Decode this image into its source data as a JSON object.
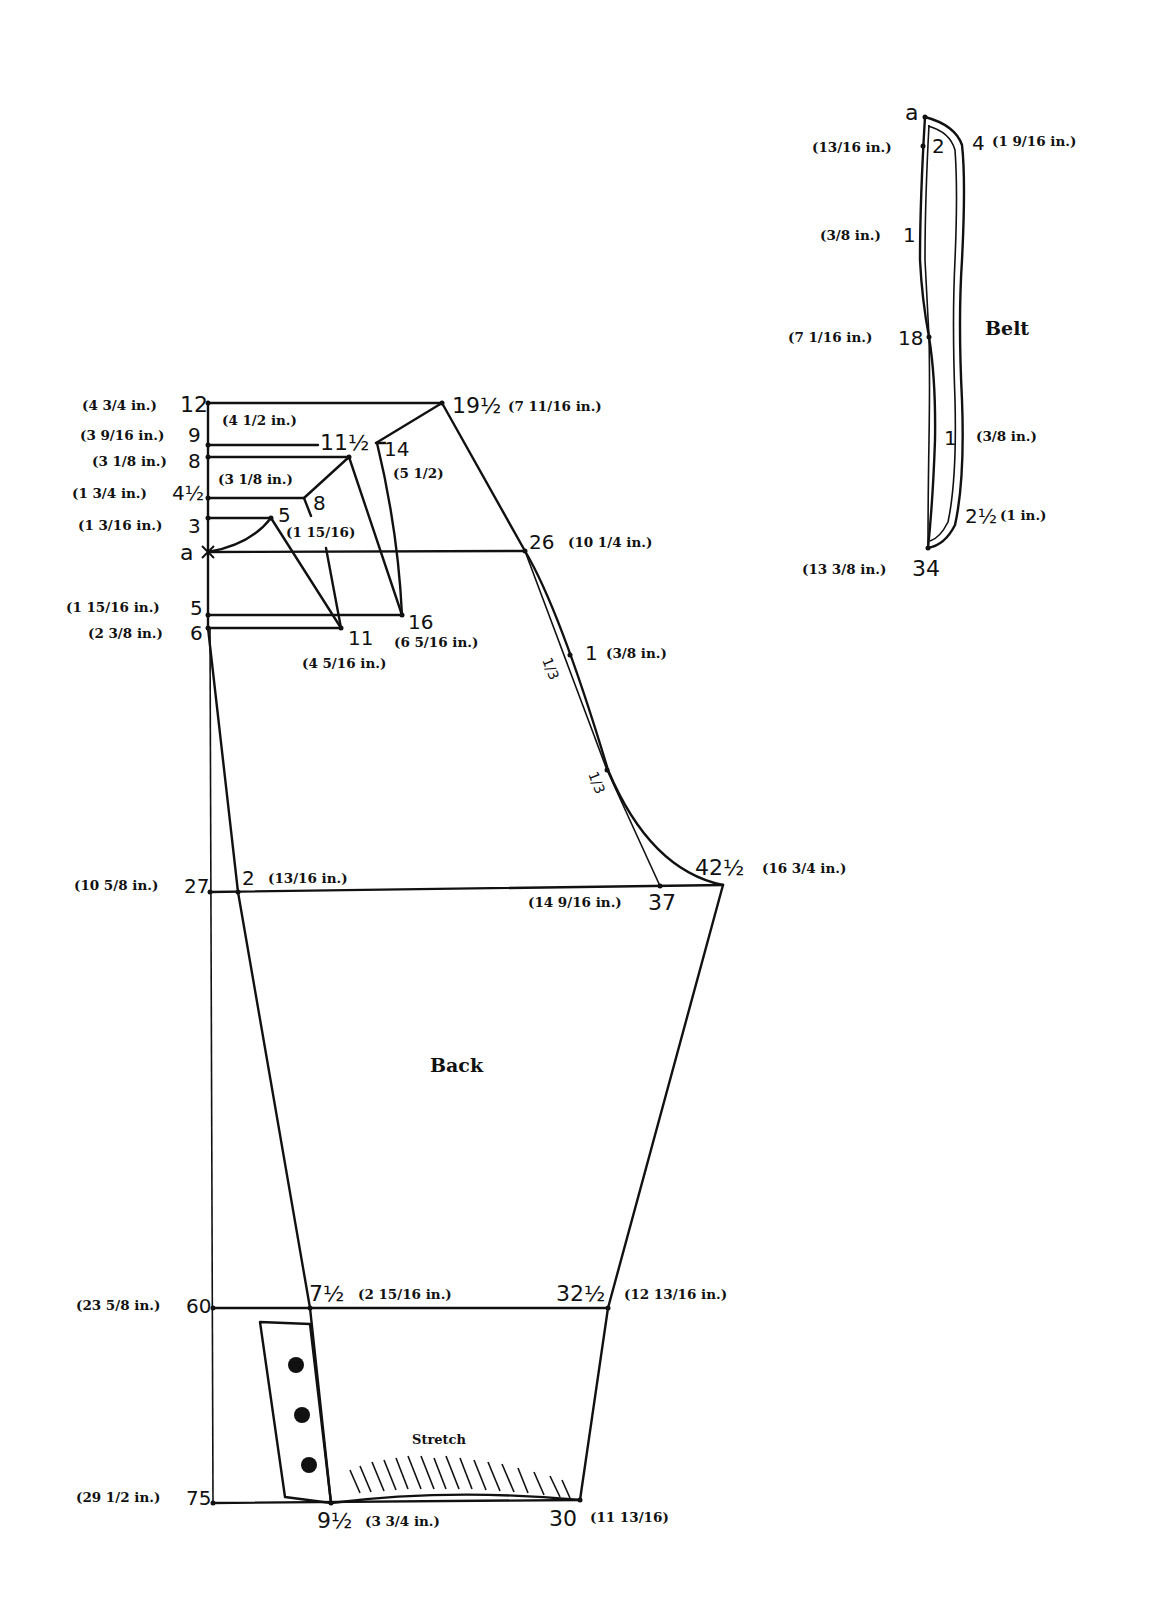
{
  "back": {
    "title": "Back",
    "stretch_label": "Stretch",
    "left_points": [
      {
        "num": "12",
        "meas": "(4 3/4 in.)"
      },
      {
        "num": "9",
        "meas": "(3 9/16 in.)"
      },
      {
        "num": "8",
        "meas": "(3 1/8 in.)"
      },
      {
        "num": "4½",
        "meas": "(1 3/4 in.)"
      },
      {
        "num": "3",
        "meas": "(1 3/16 in.)"
      },
      {
        "num": "a",
        "meas": ""
      },
      {
        "num": "5",
        "meas": "(1 15/16 in.)"
      },
      {
        "num": "6",
        "meas": "(2 3/8 in.)"
      },
      {
        "num": "27",
        "meas": "(10 5/8 in.)"
      },
      {
        "num": "60",
        "meas": "(23 5/8 in.)"
      },
      {
        "num": "75",
        "meas": "(29 1/2 in.)"
      }
    ],
    "inner_points": {
      "p19_5": {
        "num": "19½",
        "meas": "(7 11/16 in.)"
      },
      "top_width": "(4 1/2 in.)",
      "p11_5": {
        "num": "11½"
      },
      "p14": {
        "num": "14",
        "meas": "(5 1/2)"
      },
      "p8": {
        "num": "8"
      },
      "mid_width": "(3 1/8 in.)",
      "p5": {
        "num": "5",
        "meas": "(1 15/16)"
      },
      "p26": {
        "num": "26",
        "meas": "(10 1/4 in.)"
      },
      "p16": {
        "num": "16",
        "meas": "(6 5/16 in.)"
      },
      "p11": {
        "num": "11",
        "meas": "(4 5/16 in.)"
      },
      "p1": {
        "num": "1",
        "meas": "(3/8 in.)"
      },
      "third_a": "1/3",
      "third_b": "1/3",
      "p2": {
        "num": "2",
        "meas": "(13/16 in.)"
      },
      "p42_5": {
        "num": "42½",
        "meas": "(16 3/4 in.)"
      },
      "p37": {
        "num": "37",
        "meas": "(14 9/16 in.)"
      },
      "p7_5": {
        "num": "7½",
        "meas": "(2 15/16 in.)"
      },
      "p32_5": {
        "num": "32½",
        "meas": "(12 13/16 in.)"
      },
      "p9_5": {
        "num": "9½",
        "meas": "(3 3/4 in.)"
      },
      "p30": {
        "num": "30",
        "meas": "(11 13/16)"
      }
    }
  },
  "belt": {
    "title": "Belt",
    "points": {
      "a": {
        "num": "a"
      },
      "p2": {
        "num": "2",
        "meas": "(13/16 in.)"
      },
      "p4": {
        "num": "4",
        "meas": "(1 9/16 in.)"
      },
      "p1_left": {
        "num": "1",
        "meas": "(3/8 in.)"
      },
      "p18": {
        "num": "18",
        "meas": "(7 1/16 in.)"
      },
      "p1_right": {
        "num": "1",
        "meas": "(3/8 in.)"
      },
      "p2_5": {
        "num": "2½",
        "meas": "(1 in.)"
      },
      "p34": {
        "num": "34",
        "meas": "(13 3/8 in.)"
      }
    }
  }
}
